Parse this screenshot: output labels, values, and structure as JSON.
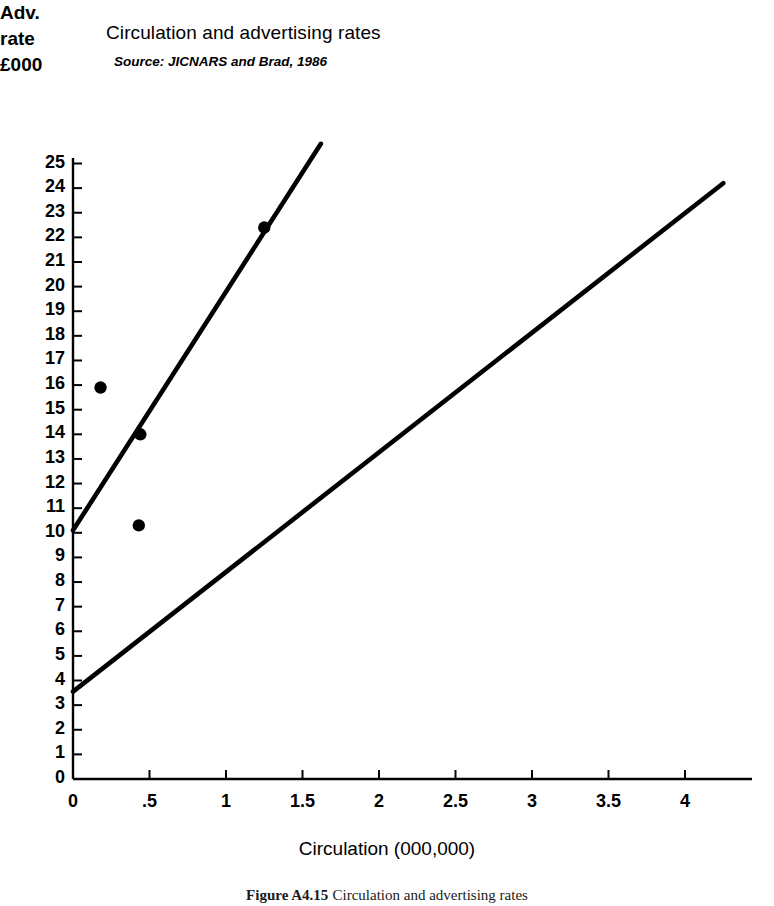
{
  "figure": {
    "title": "Circulation and advertising rates",
    "source": "Source: JICNARS and Brad, 1986",
    "caption_number": "Figure A4.15",
    "caption_text": "Circulation and advertising rates",
    "y_axis_heading_lines": [
      "Adv.",
      "rate",
      "£000"
    ],
    "x_axis_title": "Circulation (000,000)",
    "note": "Tabloid points are circled",
    "series_labels": {
      "broadsheets": "Broadsheets",
      "tabloids": "Tabloids"
    },
    "colors": {
      "ink": "#000000",
      "background": "#ffffff"
    }
  },
  "chart_data": {
    "type": "scatter",
    "title": "Circulation and advertising rates",
    "subtitle": "Source: JICNARS and Brad, 1986",
    "xlabel": "Circulation (000,000)",
    "ylabel": "Adv. rate £000",
    "xlim": [
      0,
      4.3
    ],
    "ylim": [
      0,
      25.6
    ],
    "xticks": [
      0,
      0.5,
      1,
      1.5,
      2,
      2.5,
      3,
      3.5,
      4
    ],
    "xticklabels": [
      "0",
      ".5",
      "1",
      "1.5",
      "2",
      "2.5",
      "3",
      "3.5",
      "4"
    ],
    "yticks": [
      0,
      1,
      2,
      3,
      4,
      5,
      6,
      7,
      8,
      9,
      10,
      11,
      12,
      13,
      14,
      15,
      16,
      17,
      18,
      19,
      20,
      21,
      22,
      23,
      24,
      25
    ],
    "yticklabels": [
      "0",
      "1",
      "2",
      "3",
      "4",
      "5",
      "6",
      "7",
      "8",
      "9",
      "10",
      "11",
      "12",
      "13",
      "14",
      "15",
      "16",
      "17",
      "18",
      "19",
      "20",
      "21",
      "22",
      "23",
      "24",
      "25"
    ],
    "grid": false,
    "legend": "inline-annotations",
    "annotations": [
      {
        "text": "Broadsheets",
        "x": 1.42,
        "y": 23.0
      },
      {
        "text": "Tabloids",
        "x": 2.62,
        "y": 15.3
      },
      {
        "text": "Tabloid points are circled",
        "x": 2.42,
        "y": 6.9
      }
    ],
    "series": [
      {
        "name": "Broadsheets",
        "marker": "filled-dot",
        "points": [
          {
            "x": 0.18,
            "y": 15.9
          },
          {
            "x": 0.44,
            "y": 14.0
          },
          {
            "x": 0.43,
            "y": 10.3
          },
          {
            "x": 1.25,
            "y": 22.4
          }
        ],
        "fit_line": {
          "x1": 0.0,
          "y1": 10.1,
          "x2": 1.62,
          "y2": 25.8
        }
      },
      {
        "name": "Tabloids",
        "marker": "circled-dot",
        "points": [
          {
            "x": 0.47,
            "y": 6.0
          },
          {
            "x": 0.78,
            "y": 6.5
          },
          {
            "x": 1.65,
            "y": 8.5
          },
          {
            "x": 1.87,
            "y": 14.4
          },
          {
            "x": 2.0,
            "y": 14.65
          },
          {
            "x": 3.47,
            "y": 21.0
          },
          {
            "x": 4.05,
            "y": 21.6
          }
        ],
        "fit_line": {
          "x1": 0.0,
          "y1": 3.55,
          "x2": 4.25,
          "y2": 24.2
        }
      }
    ]
  }
}
